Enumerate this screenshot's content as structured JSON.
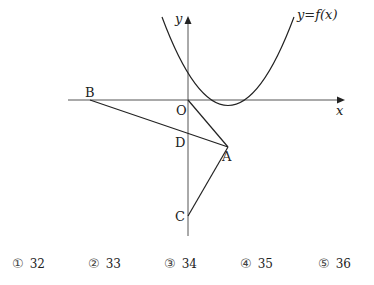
{
  "figure": {
    "axes": {
      "x_label": "x",
      "y_label": "y",
      "origin_label": "O"
    },
    "curve_label": "y=f(x)",
    "points": {
      "O": {
        "label": "O"
      },
      "A": {
        "label": "A"
      },
      "B": {
        "label": "B"
      },
      "C": {
        "label": "C"
      },
      "D": {
        "label": "D"
      }
    },
    "segments": [
      "B-A",
      "O-A",
      "C-A"
    ],
    "colors": {
      "ink": "#222222",
      "axis": "#555555",
      "background": "#ffffff"
    }
  },
  "choices": [
    {
      "marker": "①",
      "value": "32"
    },
    {
      "marker": "②",
      "value": "33"
    },
    {
      "marker": "③",
      "value": "34"
    },
    {
      "marker": "④",
      "value": "35"
    },
    {
      "marker": "⑤",
      "value": "36"
    }
  ]
}
